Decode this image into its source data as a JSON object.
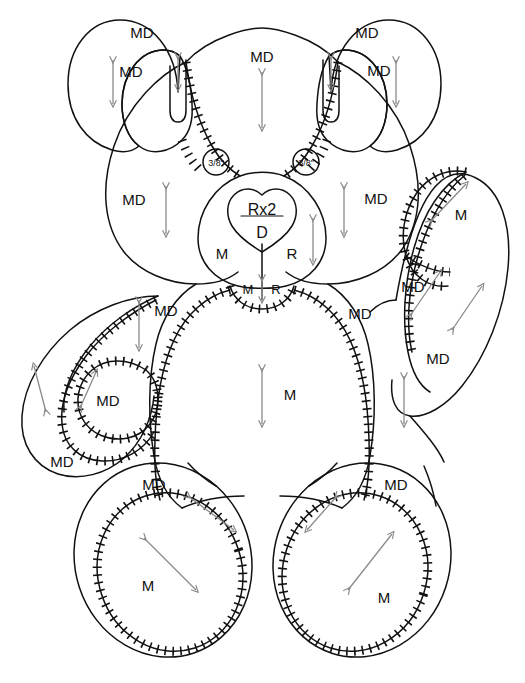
{
  "document": {
    "title": "Teddy Bear Sewing Pattern Layout",
    "top_caption": "",
    "background_color": "#ffffff",
    "line_color": "#111111",
    "arrow_color": "#8a8a8a",
    "text_color": "#111111"
  },
  "legend_codes": {
    "MD": "MD",
    "M": "M",
    "R": "R",
    "D": "D"
  },
  "pieces": {
    "ear_left_outer": {
      "label": "MD",
      "x": 142,
      "y": 33
    },
    "ear_left_inner": {
      "label": "MD",
      "x": 131,
      "y": 72
    },
    "ear_right_outer": {
      "label": "MD",
      "x": 365,
      "y": 33
    },
    "ear_right_inner": {
      "label": "MD",
      "x": 378,
      "y": 71
    },
    "head_top": {
      "label": "MD",
      "x": 262,
      "y": 57
    },
    "head_left": {
      "label": "MD",
      "x": 134,
      "y": 200
    },
    "head_right": {
      "label": "MD",
      "x": 375,
      "y": 199
    },
    "muzzle_top": {
      "numerator": "Rx2",
      "denominator": "D",
      "x": 260,
      "y": 210
    },
    "muzzle_left": {
      "label": "M",
      "x": 222,
      "y": 254
    },
    "muzzle_right": {
      "label": "R",
      "x": 291,
      "y": 254
    },
    "chin_left": {
      "label": "M",
      "x": 248,
      "y": 288
    },
    "chin_right": {
      "label": "R",
      "x": 271,
      "y": 288
    },
    "eye_dot_left": {
      "label": "3/8\"",
      "x": 216,
      "y": 162
    },
    "eye_dot_right": {
      "label": "3/8\"",
      "x": 306,
      "y": 162
    },
    "shoulder_left": {
      "label": "MD",
      "x": 163,
      "y": 311
    },
    "shoulder_right": {
      "label": "MD",
      "x": 358,
      "y": 314
    },
    "body_center": {
      "label": "M",
      "x": 288,
      "y": 394
    },
    "arm_left_outer": {
      "label": "MD",
      "x": 60,
      "y": 461
    },
    "arm_left_pad": {
      "label": "MD",
      "x": 106,
      "y": 401
    },
    "arm_right_pad": {
      "label": "M",
      "x": 460,
      "y": 214
    },
    "arm_right_mid": {
      "label": "MD",
      "x": 412,
      "y": 287
    },
    "arm_right_lower": {
      "label": "MD",
      "x": 437,
      "y": 358
    },
    "leg_left_outer": {
      "label": "MD",
      "x": 152,
      "y": 484
    },
    "leg_left_pad": {
      "label": "M",
      "x": 147,
      "y": 585
    },
    "leg_right_outer": {
      "label": "MD",
      "x": 395,
      "y": 484
    },
    "leg_right_pad": {
      "label": "M",
      "x": 383,
      "y": 597
    }
  },
  "grainline_arrows": [
    {
      "name": "ear-left-inner-grainline",
      "direction": "vertical"
    },
    {
      "name": "ear-left-tab-grainline",
      "direction": "vertical"
    },
    {
      "name": "ear-right-inner-grainline",
      "direction": "vertical"
    },
    {
      "name": "ear-right-tab-grainline",
      "direction": "vertical"
    },
    {
      "name": "head-top-grainline",
      "direction": "vertical"
    },
    {
      "name": "head-left-grainline",
      "direction": "vertical"
    },
    {
      "name": "head-right-grainline",
      "direction": "vertical"
    },
    {
      "name": "muzzle-right-grainline",
      "direction": "vertical"
    },
    {
      "name": "chin-grainline",
      "direction": "vertical"
    },
    {
      "name": "body-center-grainline",
      "direction": "vertical"
    },
    {
      "name": "shoulder-left-grainline",
      "direction": "vertical"
    },
    {
      "name": "shoulder-right-grainline",
      "direction": "vertical"
    },
    {
      "name": "arm-left-outer-grainline",
      "direction": "diagonal"
    },
    {
      "name": "arm-left-pad-grainline",
      "direction": "diagonal"
    },
    {
      "name": "arm-right-pad-grainline",
      "direction": "diagonal"
    },
    {
      "name": "arm-right-mid-grainline",
      "direction": "diagonal"
    },
    {
      "name": "arm-right-lower-grainline",
      "direction": "diagonal"
    },
    {
      "name": "leg-left-outer-grainline",
      "direction": "diagonal"
    },
    {
      "name": "leg-left-pad-grainline",
      "direction": "diagonal"
    },
    {
      "name": "leg-right-outer-grainline",
      "direction": "diagonal"
    },
    {
      "name": "leg-right-pad-grainline",
      "direction": "diagonal"
    }
  ]
}
